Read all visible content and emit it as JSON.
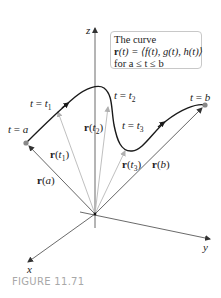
{
  "figure": {
    "caption": "FIGURE 11.71",
    "caption_color": "#a8a8a8"
  },
  "infobox": {
    "line1": "The curve",
    "line2_bold": "r",
    "line2_rest": "(t) = ⟨f(t), g(t), h(t)⟩",
    "line3": "for a ≤ t ≤ b"
  },
  "axes": {
    "x": "x",
    "y": "y",
    "z": "z"
  },
  "curve_labels": {
    "t_a": {
      "lhs": "t",
      "eq": " = ",
      "rhs": "a"
    },
    "t_1": {
      "lhs": "t",
      "eq": " = ",
      "rhs": "t",
      "sub": "1"
    },
    "t_2": {
      "lhs": "t",
      "eq": " = ",
      "rhs": "t",
      "sub": "2"
    },
    "t_3": {
      "lhs": "t",
      "eq": " = ",
      "rhs": "t",
      "sub": "3"
    },
    "t_b": {
      "lhs": "t",
      "eq": " = ",
      "rhs": "b"
    }
  },
  "vectors": {
    "r_a": {
      "bold": "r",
      "arg": "a"
    },
    "r_t1": {
      "bold": "r",
      "arg": "t",
      "sub": "1"
    },
    "r_t2": {
      "bold": "r",
      "arg": "t",
      "sub": "2"
    },
    "r_t3": {
      "bold": "r",
      "arg": "t",
      "sub": "3"
    },
    "r_b": {
      "bold": "r",
      "arg": "b"
    }
  },
  "colors": {
    "curve": "#1a1a1a",
    "axis": "#333333",
    "vector_dark": "#555555",
    "vector_light": "#b8b8b8",
    "endpoint": "#888888"
  }
}
